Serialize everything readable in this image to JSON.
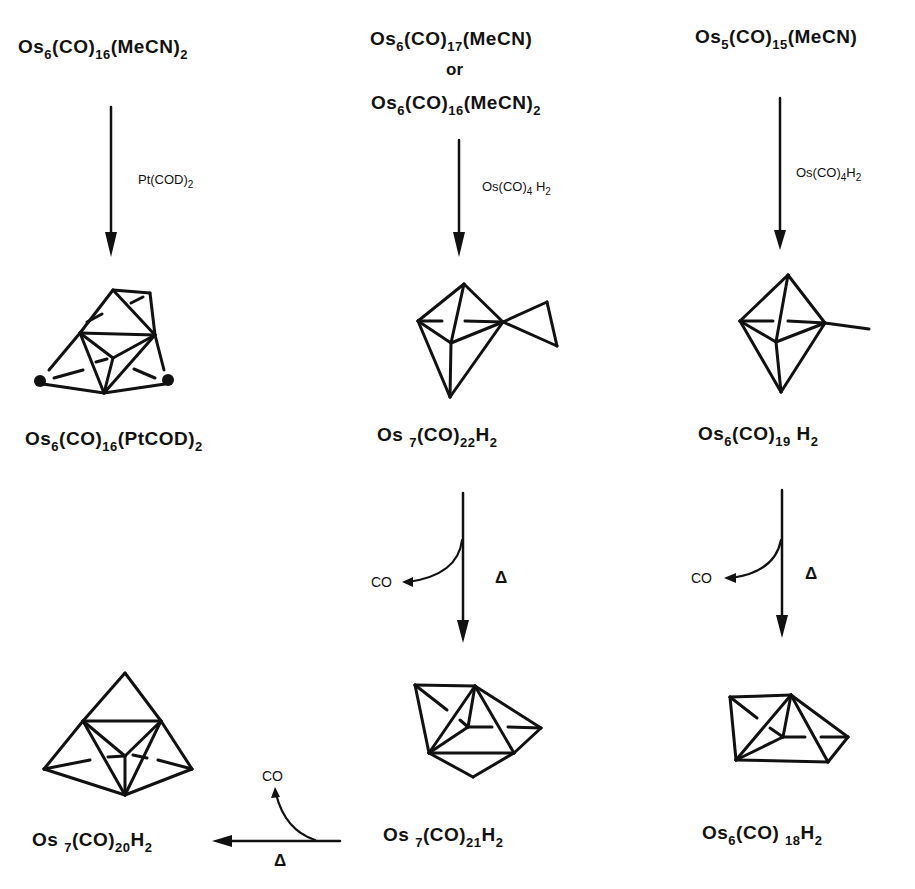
{
  "diagram": {
    "type": "reaction-scheme",
    "colors": {
      "ink": "#111111",
      "background": "#ffffff"
    }
  },
  "columns": [
    {
      "id": "left",
      "starting_material": {
        "parts": [
          [
            "Os",
            ""
          ],
          [
            "6",
            "sub"
          ],
          [
            "(CO)",
            ""
          ],
          [
            "16",
            "sub"
          ],
          [
            "(MeCN)",
            ""
          ],
          [
            "2",
            "sub"
          ]
        ],
        "text": "Os6(CO)16(MeCN)2"
      },
      "reagent": {
        "parts": [
          [
            "Pt(COD)",
            ""
          ],
          [
            "2",
            "sub"
          ]
        ],
        "text": "Pt(COD)2"
      },
      "product": {
        "parts": [
          [
            "Os",
            ""
          ],
          [
            "6",
            "sub"
          ],
          [
            "(CO)",
            ""
          ],
          [
            "16",
            "sub"
          ],
          [
            "(PtCOD)",
            ""
          ],
          [
            "2",
            "sub"
          ]
        ],
        "text": "Os6(CO)16(PtCOD)2"
      }
    },
    {
      "id": "middle",
      "starting_material": {
        "parts": [
          [
            "Os",
            ""
          ],
          [
            "6",
            "sub"
          ],
          [
            "(CO)",
            ""
          ],
          [
            "17",
            "sub"
          ],
          [
            "(MeCN)",
            ""
          ]
        ],
        "text": "Os6(CO)17(MeCN)"
      },
      "or_label": "or",
      "alt_starting_material": {
        "parts": [
          [
            "Os",
            ""
          ],
          [
            "6",
            "sub"
          ],
          [
            "(CO)",
            ""
          ],
          [
            "16",
            "sub"
          ],
          [
            "(MeCN)",
            ""
          ],
          [
            "2",
            "sub"
          ]
        ],
        "text": "Os6(CO)16(MeCN)2"
      },
      "reagent": {
        "parts": [
          [
            "Os(CO)",
            ""
          ],
          [
            "4",
            "sub"
          ],
          [
            " H",
            ""
          ],
          [
            "2",
            "sub"
          ]
        ],
        "text": "Os(CO)4H2"
      },
      "product": {
        "parts": [
          [
            "Os",
            ""
          ],
          [
            "7",
            "sub"
          ],
          [
            "(CO)",
            ""
          ],
          [
            "22",
            "sub"
          ],
          [
            "H",
            ""
          ],
          [
            "2",
            "sub"
          ]
        ],
        "text": "Os7(CO)22H2"
      },
      "step2": {
        "byproduct": "CO",
        "condition": "Δ"
      },
      "product2": {
        "parts": [
          [
            "Os",
            ""
          ],
          [
            "7",
            "sub"
          ],
          [
            "(CO)",
            ""
          ],
          [
            "21",
            "sub"
          ],
          [
            "H",
            ""
          ],
          [
            "2",
            "sub"
          ]
        ],
        "text": "Os7(CO)21H2"
      }
    },
    {
      "id": "right",
      "starting_material": {
        "parts": [
          [
            "Os",
            ""
          ],
          [
            "5",
            "sub"
          ],
          [
            "(CO)",
            ""
          ],
          [
            "15",
            "sub"
          ],
          [
            "(MeCN)",
            ""
          ]
        ],
        "text": "Os5(CO)15(MeCN)"
      },
      "reagent": {
        "parts": [
          [
            "Os(CO)",
            ""
          ],
          [
            "4",
            "sub"
          ],
          [
            "H",
            ""
          ],
          [
            "2",
            "sub"
          ]
        ],
        "text": "Os(CO)4H2"
      },
      "product": {
        "parts": [
          [
            "Os",
            ""
          ],
          [
            "6",
            "sub"
          ],
          [
            "(CO)",
            ""
          ],
          [
            "19",
            "sub"
          ],
          [
            "H",
            ""
          ],
          [
            "2",
            "sub"
          ]
        ],
        "text": "Os6(CO)19H2"
      },
      "step2": {
        "byproduct": "CO",
        "condition": "Δ"
      },
      "product2": {
        "parts": [
          [
            "Os",
            ""
          ],
          [
            "6",
            "sub"
          ],
          [
            "(CO)",
            ""
          ],
          [
            "18",
            "sub"
          ],
          [
            "H",
            ""
          ],
          [
            "2",
            "sub"
          ]
        ],
        "text": "Os6(CO)18H2"
      }
    }
  ],
  "bottom_left": {
    "byproduct": "CO",
    "condition": "Δ",
    "product": {
      "parts": [
        [
          "Os",
          ""
        ],
        [
          "7",
          "sub"
        ],
        [
          "(CO)",
          ""
        ],
        [
          "20",
          "sub"
        ],
        [
          "H",
          ""
        ],
        [
          "2",
          "sub"
        ]
      ],
      "text": "Os7(CO)20H2"
    }
  }
}
